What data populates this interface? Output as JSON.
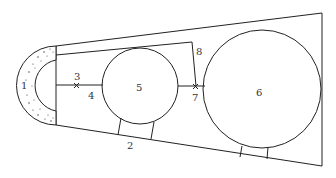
{
  "diagram": {
    "type": "schematic",
    "labels": [
      {
        "id": "1",
        "text": "1",
        "x": 21,
        "y": 89
      },
      {
        "id": "2",
        "text": "2",
        "x": 127,
        "y": 149
      },
      {
        "id": "3",
        "text": "3",
        "x": 76,
        "y": 79
      },
      {
        "id": "4",
        "text": "4",
        "x": 89,
        "y": 99
      },
      {
        "id": "5",
        "text": "5",
        "x": 139,
        "y": 91
      },
      {
        "id": "6",
        "text": "6",
        "x": 257,
        "y": 96
      },
      {
        "id": "7",
        "text": "7",
        "x": 193,
        "y": 101
      },
      {
        "id": "8",
        "text": "8",
        "x": 195,
        "y": 54
      }
    ],
    "colors": {
      "stroke": "#222222",
      "background": "#ffffff"
    }
  }
}
